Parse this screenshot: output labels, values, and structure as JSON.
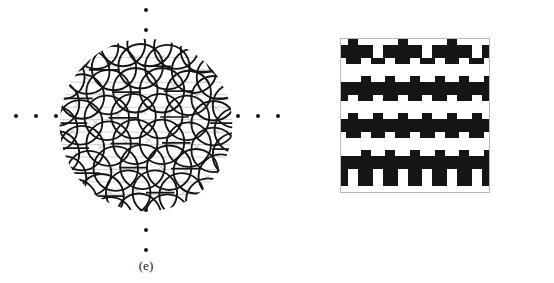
{
  "figure": {
    "caption_e": "(e)",
    "caption_f": "(f)",
    "background_color": "#ffffff",
    "ink_color": "#151515"
  },
  "panel_e": {
    "label": "(e)",
    "name": "hyperbolic-disk-tiling",
    "description": "Poincare disk with overlapping circular-arc tiling",
    "dots_left_count": 3,
    "dots_right_count": 3,
    "dots_top_count": 2,
    "dots_bottom_count": 3,
    "line_color": "#151515",
    "faint_color": "#9a9a9a"
  },
  "panel_f": {
    "label": "(f)",
    "name": "square-tetromino-tiling",
    "description": "Square patch of interlocking black and white T-tetromino tiles",
    "dots_left_count": 1,
    "dots_right_count": 1,
    "dots_top_count": 3,
    "dots_bottom_count": 3,
    "tile_black": "#151515",
    "tile_white": "#ffffff",
    "border_color": "#b9b9b9",
    "columns": 6,
    "rows": 8
  }
}
